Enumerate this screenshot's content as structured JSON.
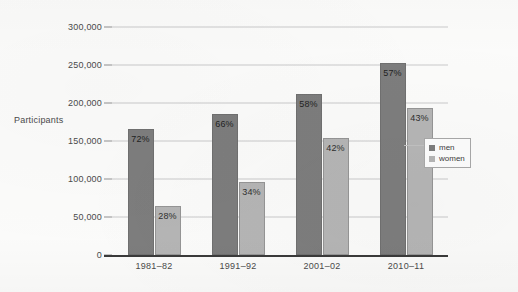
{
  "chart_data": {
    "type": "bar",
    "title": "",
    "subtitle": "",
    "xlabel": "",
    "ylabel": "Participants",
    "categories": [
      "1981–82",
      "1991–92",
      "2001–02",
      "2010–11"
    ],
    "ylim": [
      0,
      300000
    ],
    "yticks": [
      0,
      50000,
      100000,
      150000,
      200000,
      250000,
      300000
    ],
    "ytick_labels": [
      "0",
      "50,000",
      "100,000",
      "150,000",
      "200,000",
      "250,000",
      "300,000"
    ],
    "grid": true,
    "legend_position": "right",
    "series": [
      {
        "name": "men",
        "color": "#7d7d7d",
        "values": [
          166000,
          186000,
          212000,
          253000
        ],
        "data_labels": [
          "72%",
          "66%",
          "58%",
          "57%"
        ]
      },
      {
        "name": "women",
        "color": "#b5b5b5",
        "values": [
          64000,
          96000,
          154000,
          193000
        ],
        "data_labels": [
          "28%",
          "34%",
          "42%",
          "43%"
        ]
      }
    ]
  },
  "legend": {
    "items": [
      {
        "label": "men",
        "color": "#7d7d7d"
      },
      {
        "label": "women",
        "color": "#b5b5b5"
      }
    ]
  },
  "colors": {
    "men": "#7d7d7d",
    "women": "#b5b5b5",
    "gridline": "#c9c9c9",
    "axis": "#3a3a3a",
    "text": "#4a4a4a",
    "background": "#fbfbfa"
  }
}
